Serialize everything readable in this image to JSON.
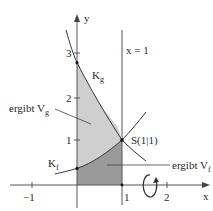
{
  "diagram": {
    "type": "function-graph-solid-of-revolution",
    "axes": {
      "x_label": "x",
      "y_label": "y",
      "x_ticks": [
        {
          "value": -1,
          "label": "−1"
        },
        {
          "value": 1,
          "label": "1"
        },
        {
          "value": 2,
          "label": "2"
        }
      ],
      "y_ticks": [
        {
          "value": 1,
          "label": "1"
        },
        {
          "value": 2,
          "label": "2"
        },
        {
          "value": 3,
          "label": "3"
        }
      ]
    },
    "curves": [
      {
        "name": "K_g",
        "label_main": "K",
        "label_sub": "g",
        "expression": "e^(1-x)"
      },
      {
        "name": "K_f",
        "label_main": "K",
        "label_sub": "f",
        "expression": "e^(x-1)"
      }
    ],
    "vertical_line": {
      "label": "x = 1",
      "x": 1
    },
    "point": {
      "label": "S(1|1)",
      "x": 1,
      "y": 1
    },
    "regions": [
      {
        "name": "V_g",
        "annotation_main": "ergibt V",
        "annotation_sub": "g",
        "fill": "#cfcfcf"
      },
      {
        "name": "V_f",
        "annotation_main": "ergibt V",
        "annotation_sub": "f",
        "fill": "#9a9a9a"
      }
    ],
    "rotation_axis": "x-axis",
    "colors": {
      "line": "#3a3a3a",
      "axis": "#555555",
      "light_region": "#cfcfcf",
      "dark_region": "#9a9a9a",
      "background": "#ffffff"
    }
  }
}
